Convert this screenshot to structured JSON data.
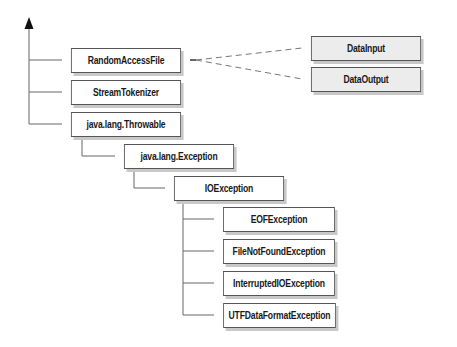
{
  "diagram": {
    "type": "class-hierarchy",
    "colors": {
      "line": "#666666",
      "box_border": "#555555",
      "box_fill": "#ffffff",
      "interface_fill": "#ececec",
      "shadow": "#c8c8c8",
      "text": "#1a1a1a"
    },
    "root_arrow": "inheritance-arrow-up",
    "classes": [
      {
        "id": "randomaccessfile",
        "label": "RandomAccessFile",
        "kind": "class",
        "parent": "root"
      },
      {
        "id": "streamtokenizer",
        "label": "StreamTokenizer",
        "kind": "class",
        "parent": "root"
      },
      {
        "id": "throwable",
        "label": "java.lang.Throwable",
        "kind": "class",
        "parent": "root"
      },
      {
        "id": "exception",
        "label": "java.lang.Exception",
        "kind": "class",
        "parent": "throwable"
      },
      {
        "id": "ioexception",
        "label": "IOException",
        "kind": "class",
        "parent": "exception"
      },
      {
        "id": "eofexception",
        "label": "EOFException",
        "kind": "class",
        "parent": "ioexception"
      },
      {
        "id": "filenotfoundexception",
        "label": "FileNotFoundException",
        "kind": "class",
        "parent": "ioexception"
      },
      {
        "id": "interruptedioexception",
        "label": "InterruptedIOException",
        "kind": "class",
        "parent": "ioexception"
      },
      {
        "id": "utfdataformatexception",
        "label": "UTFDataFormatException",
        "kind": "class",
        "parent": "ioexception"
      }
    ],
    "interfaces": [
      {
        "id": "datainput",
        "label": "DataInput",
        "kind": "interface"
      },
      {
        "id": "dataoutput",
        "label": "DataOutput",
        "kind": "interface"
      }
    ],
    "implements": [
      {
        "from": "randomaccessfile",
        "to": "datainput",
        "style": "dashed"
      },
      {
        "from": "randomaccessfile",
        "to": "dataoutput",
        "style": "dashed"
      }
    ]
  }
}
